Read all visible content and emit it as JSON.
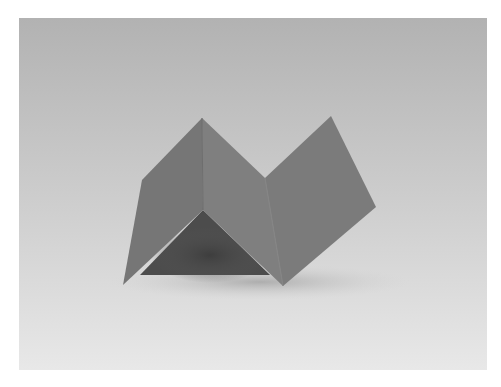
{
  "photo": {
    "subject": "folded-paper-zigzag",
    "colors": {
      "background_top": "#b3b3b3",
      "background_bottom": "#e6e6e6",
      "paper_left_face": "#747474",
      "paper_middle_face": "#7e7e7e",
      "paper_right_face": "#7a7a7a",
      "shadow": "#4a4a4a"
    }
  }
}
